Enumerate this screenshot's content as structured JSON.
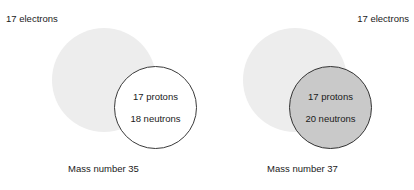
{
  "figure": {
    "background_color": "#ffffff",
    "electron_cloud_color": "#ededed",
    "nucleus_outline_color": "#333333",
    "nucleus_fill_unshaded": "#ffffff",
    "nucleus_fill_shaded": "#c9c9c9",
    "text_color": "#1a1a1a"
  },
  "atoms": [
    {
      "id": "chlorine-35",
      "electron_label": "17 electrons",
      "protons": "17 protons",
      "neutrons": "18 neutrons",
      "mass_caption": "Mass number 35",
      "nucleus_shaded": false
    },
    {
      "id": "chlorine-37",
      "electron_label": "17 electrons",
      "protons": "17 protons",
      "neutrons": "20 neutrons",
      "mass_caption": "Mass number 37",
      "nucleus_shaded": true
    }
  ],
  "chart_data": {
    "type": "diagram",
    "subtitle": "",
    "xlabel": "",
    "ylabel": "",
    "legend": [],
    "annotations": [
      "17 electrons",
      "17 protons",
      "18 neutrons",
      "Mass number 35",
      "17 electrons",
      "17 protons",
      "20 neutrons",
      "Mass number 37"
    ],
    "categories": [
      "Mass number 35",
      "Mass number 37"
    ],
    "series": [
      {
        "name": "electrons",
        "values": [
          17,
          17
        ]
      },
      {
        "name": "protons",
        "values": [
          17,
          17
        ]
      },
      {
        "name": "neutrons",
        "values": [
          18,
          20
        ]
      },
      {
        "name": "mass number",
        "values": [
          35,
          37
        ]
      }
    ]
  }
}
